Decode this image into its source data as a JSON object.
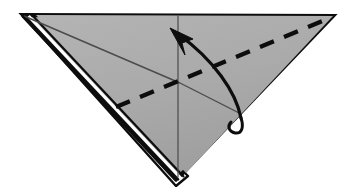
{
  "figure": {
    "kind": "origami-fold-diagram",
    "title": "Origami step diagram: inverted triangle with valley-fold and curved fold arrow",
    "canvas": {
      "width": 349,
      "height": 187,
      "background": "#ffffff"
    }
  },
  "colors": {
    "paper_fill": "#a9a9a9",
    "paper_fill_light": "#b2b2b2",
    "outline": "#0d0d0d",
    "crease_thin": "#4a4a4a",
    "fold_dash": "#0d0d0d",
    "arrow": "#0d0d0d",
    "layer_gap": "#ffffff"
  },
  "shapes": {
    "paper_triangle": {
      "name": "inverted-triangle-paper",
      "points": "23,15 333,16 178,178",
      "stroke_width": 4
    },
    "under_layer": {
      "name": "hidden-under-layer",
      "points": "26,19 176,184 186,176",
      "stroke_width": 2
    }
  },
  "creases": {
    "vertical_center": {
      "name": "vertical-center-crease",
      "x1": 178,
      "y1": 16,
      "x2": 178,
      "y2": 178,
      "width": 1.1
    },
    "left_diagonal": {
      "name": "left-diagonal-crease",
      "x1": 24,
      "y1": 16,
      "x2": 180,
      "y2": 83,
      "width": 1.2
    },
    "right_diagonal": {
      "name": "right-diagonal-crease",
      "x1": 180,
      "y1": 83,
      "x2": 247,
      "y2": 117,
      "width": 1.2
    }
  },
  "fold_line": {
    "name": "valley-fold-dashed-line",
    "label": "valley fold",
    "x1": 117,
    "y1": 106,
    "x2": 331,
    "y2": 17,
    "dash_pattern": "15 11",
    "width": 4
  },
  "arrow": {
    "name": "curved-fold-arrow",
    "label": "fold up and over",
    "path": "M 241,118 C 236,92 214,60 176,33",
    "width": 3.2,
    "head": {
      "name": "arrow-head",
      "points": "170,29 191,38 182,42 184,52"
    },
    "tail_hook": {
      "name": "arrow-tail-hook",
      "path": "M 241,118 C 243,128 241,133 234,132 C 229,131 228,126 231,123",
      "width": 3
    }
  },
  "layer_edges": [
    {
      "name": "layer-edge-outer",
      "x1": 24,
      "y1": 17,
      "x2": 177,
      "y2": 181,
      "width": 3.2,
      "color": "#0d0d0d"
    },
    {
      "name": "layer-edge-gap",
      "x1": 28,
      "y1": 17,
      "x2": 181,
      "y2": 180,
      "width": 3.0,
      "color": "#ffffff"
    },
    {
      "name": "layer-edge-inner",
      "x1": 32,
      "y1": 17,
      "x2": 184,
      "y2": 178,
      "width": 2.2,
      "color": "#0d0d0d"
    }
  ]
}
